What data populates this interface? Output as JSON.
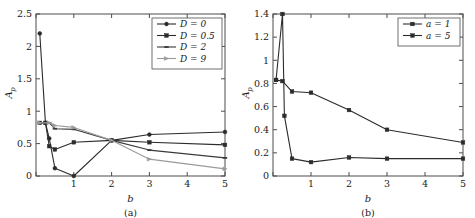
{
  "figure": {
    "panels": [
      {
        "caption": "(a)",
        "xlabel": "b",
        "ylabel": "A",
        "ylabel_sub": "p",
        "xticks": [
          0,
          1,
          2,
          3,
          4,
          5
        ],
        "xtick_labels": [
          "",
          "1",
          "2",
          "3",
          "4",
          "5"
        ],
        "yticks": [
          0,
          0.5,
          1,
          1.5,
          2,
          2.5
        ],
        "ytick_labels": [
          "0",
          "0.5",
          "1",
          "1.5",
          "2",
          "2.5"
        ],
        "xlim": [
          0,
          5
        ],
        "ylim": [
          0,
          2.5
        ],
        "legend_position": "top-right",
        "series": [
          {
            "name": "D = 0",
            "color": "#2b2b2b",
            "marker": "circle",
            "x": [
              0.1,
              0.25,
              0.35,
              0.5,
              1.0,
              2.0,
              3.0,
              5.0
            ],
            "y": [
              2.2,
              0.82,
              0.58,
              0.12,
              0.0,
              0.55,
              0.64,
              0.68
            ]
          },
          {
            "name": "D = 0.5",
            "color": "#2b2b2b",
            "marker": "square",
            "x": [
              0.1,
              0.25,
              0.35,
              0.5,
              1.0,
              2.0,
              3.0,
              5.0
            ],
            "y": [
              0.82,
              0.82,
              0.46,
              0.41,
              0.52,
              0.55,
              0.52,
              0.48
            ]
          },
          {
            "name": "D = 2",
            "color": "#3a3a3a",
            "marker": "dash",
            "x": [
              0.1,
              0.35,
              0.5,
              1.0,
              2.0,
              3.0,
              5.0
            ],
            "y": [
              0.82,
              0.82,
              0.73,
              0.72,
              0.55,
              0.4,
              0.28
            ]
          },
          {
            "name": "D = 9",
            "color": "#9a9a9a",
            "marker": "triangle",
            "x": [
              0.1,
              0.35,
              0.5,
              1.0,
              2.0,
              3.0,
              5.0
            ],
            "y": [
              0.82,
              0.82,
              0.78,
              0.75,
              0.55,
              0.26,
              0.11
            ]
          }
        ]
      },
      {
        "caption": "(b)",
        "xlabel": "b",
        "ylabel": "A",
        "ylabel_sub": "p",
        "xticks": [
          0,
          1,
          2,
          3,
          4,
          5
        ],
        "xtick_labels": [
          "",
          "1",
          "2",
          "3",
          "4",
          "5"
        ],
        "yticks": [
          0,
          0.2,
          0.4,
          0.6,
          0.8,
          1.0,
          1.2,
          1.4
        ],
        "ytick_labels": [
          "0",
          "0.2",
          "0.4",
          "0.6",
          "0.8",
          "1",
          "1.2",
          "1.4"
        ],
        "xlim": [
          0,
          5
        ],
        "ylim": [
          0,
          1.4
        ],
        "legend_position": "top-right",
        "series": [
          {
            "name": "a = 1",
            "color": "#2b2b2b",
            "marker": "square",
            "x": [
              0.08,
              0.25,
              0.5,
              1.0,
              2.0,
              3.0,
              5.0
            ],
            "y": [
              0.83,
              0.82,
              0.73,
              0.72,
              0.57,
              0.4,
              0.29
            ]
          },
          {
            "name": "a = 5",
            "color": "#2b2b2b",
            "marker": "square",
            "x": [
              0.08,
              0.25,
              0.3,
              0.5,
              1.0,
              2.0,
              3.0,
              5.0
            ],
            "y": [
              0.83,
              1.4,
              0.52,
              0.15,
              0.12,
              0.16,
              0.15,
              0.15
            ]
          }
        ]
      }
    ]
  },
  "colors": {
    "axis": "#4d4d4d",
    "text": "#1a1a1a",
    "background": "#ffffff"
  },
  "chart_data": [
    {
      "type": "line",
      "title": "(a)",
      "xlabel": "b",
      "ylabel": "A_p",
      "xlim": [
        0,
        5
      ],
      "ylim": [
        0,
        2.5
      ],
      "grid": false,
      "legend_position": "upper right",
      "legend": [
        "D = 0",
        "D = 0.5",
        "D = 2",
        "D = 9"
      ],
      "series": [
        {
          "name": "D = 0",
          "x": [
            0.1,
            0.25,
            0.35,
            0.5,
            1.0,
            2.0,
            3.0,
            5.0
          ],
          "values": [
            2.2,
            0.82,
            0.58,
            0.12,
            0.0,
            0.55,
            0.64,
            0.68
          ]
        },
        {
          "name": "D = 0.5",
          "x": [
            0.1,
            0.25,
            0.35,
            0.5,
            1.0,
            2.0,
            3.0,
            5.0
          ],
          "values": [
            0.82,
            0.82,
            0.46,
            0.41,
            0.52,
            0.55,
            0.52,
            0.48
          ]
        },
        {
          "name": "D = 2",
          "x": [
            0.1,
            0.35,
            0.5,
            1.0,
            2.0,
            3.0,
            5.0
          ],
          "values": [
            0.82,
            0.82,
            0.73,
            0.72,
            0.55,
            0.4,
            0.28
          ]
        },
        {
          "name": "D = 9",
          "x": [
            0.1,
            0.35,
            0.5,
            1.0,
            2.0,
            3.0,
            5.0
          ],
          "values": [
            0.82,
            0.82,
            0.78,
            0.75,
            0.55,
            0.26,
            0.11
          ]
        }
      ]
    },
    {
      "type": "line",
      "title": "(b)",
      "xlabel": "b",
      "ylabel": "A_p",
      "xlim": [
        0,
        5
      ],
      "ylim": [
        0,
        1.4
      ],
      "grid": false,
      "legend_position": "upper right",
      "legend": [
        "a = 1",
        "a = 5"
      ],
      "series": [
        {
          "name": "a = 1",
          "x": [
            0.08,
            0.25,
            0.5,
            1.0,
            2.0,
            3.0,
            5.0
          ],
          "values": [
            0.83,
            0.82,
            0.73,
            0.72,
            0.57,
            0.4,
            0.29
          ]
        },
        {
          "name": "a = 5",
          "x": [
            0.08,
            0.25,
            0.3,
            0.5,
            1.0,
            2.0,
            3.0,
            5.0
          ],
          "values": [
            0.83,
            1.4,
            0.52,
            0.15,
            0.12,
            0.16,
            0.15,
            0.15
          ]
        }
      ]
    }
  ]
}
